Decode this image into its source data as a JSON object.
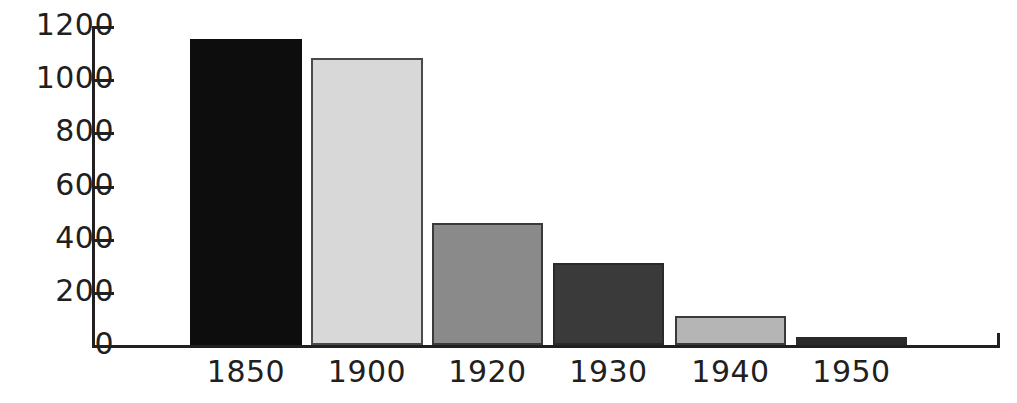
{
  "chart_data": {
    "type": "bar",
    "title": "",
    "subtitle": "",
    "xlabel": "",
    "ylabel": "",
    "categories": [
      "1850",
      "1900",
      "1920",
      "1930",
      "1940",
      "1950"
    ],
    "values": [
      1150,
      1080,
      460,
      310,
      110,
      30
    ],
    "series": [
      {
        "name": "",
        "values": [
          1150,
          1080,
          460,
          310,
          110,
          30
        ]
      }
    ],
    "bar_colors": [
      "#0d0d0d",
      "#d8d8d8",
      "#8a8a8a",
      "#3a3a3a",
      "#b5b5b5",
      "#2a2a2a"
    ],
    "bar_border_color": "#231f20",
    "ylim": [
      0,
      1200
    ],
    "y_ticks": [
      0,
      200,
      400,
      600,
      800,
      1000,
      1200
    ],
    "y_tick_labels": [
      "0",
      "200",
      "400",
      "600",
      "800",
      "1000",
      "1200"
    ],
    "grid": false,
    "legend": null,
    "axis_color": "#231f20",
    "background": "#ffffff"
  },
  "axis": {
    "y_labels": [
      "1200",
      "1000",
      "800",
      "600",
      "400",
      "200",
      "0"
    ],
    "x_labels": [
      "1850",
      "1900",
      "1920",
      "1930",
      "1940",
      "1950"
    ]
  },
  "bars": [
    {
      "label": "1850",
      "value": 1150,
      "color": "#0d0d0d",
      "border": "#0d0d0d",
      "left": 190,
      "width": 112
    },
    {
      "label": "1900",
      "value": 1080,
      "color": "#d8d8d8",
      "border": "#4a4a4a",
      "left": 311,
      "width": 112
    },
    {
      "label": "1920",
      "value": 460,
      "color": "#8a8a8a",
      "border": "#3a3a3a",
      "left": 432,
      "width": 111
    },
    {
      "label": "1930",
      "value": 310,
      "color": "#3a3a3a",
      "border": "#2a2a2a",
      "left": 553,
      "width": 111
    },
    {
      "label": "1940",
      "value": 110,
      "color": "#b5b5b5",
      "border": "#3a3a3a",
      "left": 675,
      "width": 111
    },
    {
      "label": "1950",
      "value": 30,
      "color": "#2a2a2a",
      "border": "#2a2a2a",
      "left": 796,
      "width": 111
    }
  ]
}
